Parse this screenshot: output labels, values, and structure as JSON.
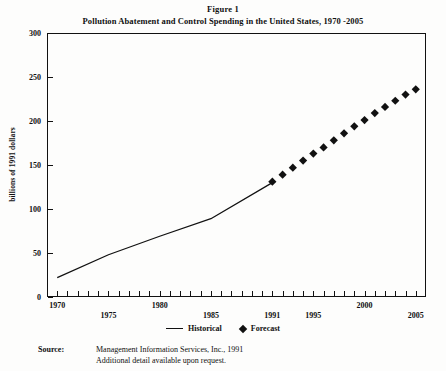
{
  "figure": {
    "label": "Figure 1",
    "title": "Pollution Abatement and Control Spending in the United States, 1970 -2005"
  },
  "legend": {
    "historical": "Historical",
    "forecast": "Forecast"
  },
  "source": {
    "label": "Source:",
    "line1": "Management Information Services, Inc., 1991",
    "line2": "Additional detail available upon request."
  },
  "chart_data": {
    "type": "line",
    "title": "Pollution Abatement and Control Spending in the United States, 1970 -2005",
    "xlabel": "",
    "ylabel": "billions of 1991 dollars",
    "xlim": [
      1969,
      2006
    ],
    "ylim": [
      0,
      300
    ],
    "grid": false,
    "legend_position": "below-plot-center",
    "yticks": [
      0,
      50,
      100,
      150,
      200,
      250,
      300
    ],
    "ytick_labels": [
      "0",
      "50",
      "100",
      "150",
      "200",
      "250",
      "300"
    ],
    "xticks": [
      1970,
      1971,
      1972,
      1973,
      1974,
      1975,
      1976,
      1977,
      1978,
      1979,
      1980,
      1981,
      1982,
      1983,
      1984,
      1985,
      1986,
      1987,
      1988,
      1989,
      1990,
      1991,
      1992,
      1993,
      1994,
      1995,
      1996,
      1997,
      1998,
      1999,
      2000,
      2001,
      2002,
      2003,
      2004,
      2005
    ],
    "xtick_labels_shown": [
      {
        "x": 1970,
        "label": "1970",
        "row": 0
      },
      {
        "x": 1975,
        "label": "1975",
        "row": 1
      },
      {
        "x": 1980,
        "label": "1980",
        "row": 0
      },
      {
        "x": 1985,
        "label": "1985",
        "row": 1
      },
      {
        "x": 1991,
        "label": "1991",
        "row": 1
      },
      {
        "x": 1995,
        "label": "1995",
        "row": 1
      },
      {
        "x": 2000,
        "label": "2000",
        "row": 0
      },
      {
        "x": 2005,
        "label": "2005",
        "row": 1
      }
    ],
    "series": [
      {
        "name": "Historical",
        "style": "line",
        "x": [
          1970,
          1975,
          1980,
          1985,
          1991
        ],
        "values": [
          22,
          48,
          69,
          89,
          130
        ]
      },
      {
        "name": "Forecast",
        "style": "diamond-markers",
        "x": [
          1991,
          1992,
          1993,
          1994,
          1995,
          1996,
          1997,
          1998,
          1999,
          2000,
          2001,
          2002,
          2003,
          2004,
          2005
        ],
        "values": [
          131,
          139,
          147,
          155,
          163,
          170,
          178,
          186,
          194,
          201,
          209,
          216,
          223,
          230,
          236
        ]
      }
    ]
  }
}
